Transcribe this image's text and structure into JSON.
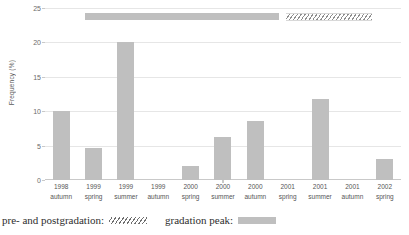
{
  "chart_data": {
    "type": "bar",
    "title": "",
    "xlabel": "",
    "ylabel": "Frequency (%)",
    "ylim": [
      0,
      25
    ],
    "yticks": [
      0,
      5,
      10,
      15,
      20,
      25
    ],
    "grid": true,
    "legend_position": "below",
    "categories": [
      "1998 autumn",
      "1999 spring",
      "1999 summer",
      "1999 autumn",
      "2000 spring",
      "2000 summer",
      "2000 autumn",
      "2001 spring",
      "2001 summer",
      "2001 autumn",
      "2002 spring"
    ],
    "category_lines": [
      {
        "year": "1998",
        "season": "autumn"
      },
      {
        "year": "1999",
        "season": "spring"
      },
      {
        "year": "1999",
        "season": "summer"
      },
      {
        "year": "1999",
        "season": "autumn"
      },
      {
        "year": "2000",
        "season": "spring"
      },
      {
        "year": "2000",
        "season": "summer"
      },
      {
        "year": "2000",
        "season": "autumn"
      },
      {
        "year": "2001",
        "season": "spring"
      },
      {
        "year": "2001",
        "season": "summer"
      },
      {
        "year": "2001",
        "season": "autumn"
      },
      {
        "year": "2002",
        "season": "spring"
      }
    ],
    "values": [
      10,
      4.6,
      20,
      0,
      2,
      6.2,
      8.6,
      0,
      11.8,
      0,
      3
    ],
    "bar_color": "#bfbfbf",
    "annotations": [
      {
        "name": "gradation-peak-range",
        "style": "solid",
        "color": "#bfbfbf",
        "start_category": "1999 spring",
        "end_category": "2001 spring",
        "y": 23
      },
      {
        "name": "pre-and-postgradation-range",
        "style": "hatched",
        "color": "#8f8f8f",
        "start_category": "2001 spring",
        "end_category": "2002 spring",
        "y": 23
      }
    ]
  },
  "legend": {
    "entries": [
      {
        "label": "pre- and postgradation:",
        "swatch": "hatched"
      },
      {
        "label": "gradation peak:",
        "swatch": "solid"
      }
    ]
  },
  "colors": {
    "bar": "#bfbfbf",
    "hatch": "#8f8f8f",
    "grid": "#d9d9d9",
    "axis": "#c9c9c9",
    "text": "#555555"
  }
}
